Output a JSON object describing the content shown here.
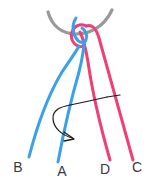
{
  "diagram": {
    "canvas": {
      "width": 152,
      "height": 182,
      "background": "#ffffff"
    },
    "colors": {
      "blue_strand": "#3aa0e8",
      "pink_strand": "#ef3f74",
      "loop_arc": "#999999",
      "arrow": "#1c1c1c",
      "label": "#3a3a3a"
    },
    "labels": [
      {
        "id": "label-b",
        "text": "B",
        "x": 18,
        "y": 172,
        "strand": "blue"
      },
      {
        "id": "label-a",
        "text": "A",
        "x": 62,
        "y": 176,
        "strand": "blue"
      },
      {
        "id": "label-d",
        "text": "D",
        "x": 105,
        "y": 174,
        "strand": "pink"
      },
      {
        "id": "label-c",
        "text": "C",
        "x": 137,
        "y": 172,
        "strand": "pink"
      }
    ],
    "elements": {
      "loop_arc_name": "tissue-loop-arc",
      "arrow_name": "rotation-arrow",
      "arrow_direction": "clockwise-down-right"
    }
  }
}
